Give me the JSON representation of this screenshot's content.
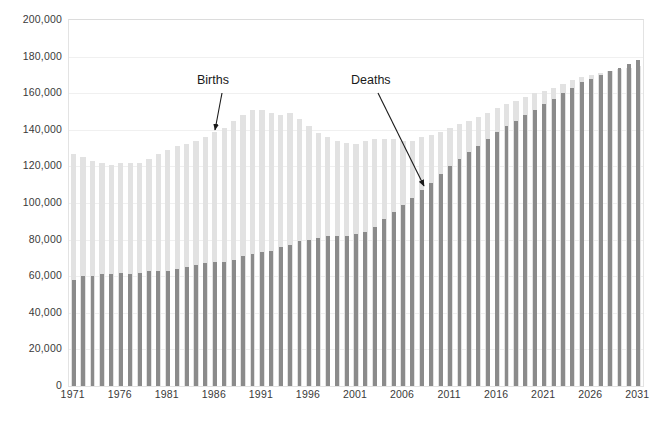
{
  "chart_data": {
    "type": "bar",
    "title": "",
    "subtitle": "",
    "xlabel": "",
    "ylabel": "",
    "ylim": [
      0,
      200000
    ],
    "ytick_step": 20000,
    "ytick_labels": [
      "0",
      "20,000",
      "40,000",
      "60,000",
      "80,000",
      "100,000",
      "120,000",
      "140,000",
      "160,000",
      "180,000",
      "200,000"
    ],
    "ytick_values": [
      0,
      20000,
      40000,
      60000,
      80000,
      100000,
      120000,
      140000,
      160000,
      180000,
      200000
    ],
    "grid": true,
    "legend_position": "annotations",
    "xtick_labels": [
      "1971",
      "1976",
      "1981",
      "1986",
      "1991",
      "1996",
      "2001",
      "2006",
      "2011",
      "2016",
      "2021",
      "2026",
      "2031"
    ],
    "xtick_values": [
      1971,
      1976,
      1981,
      1986,
      1991,
      1996,
      2001,
      2006,
      2011,
      2016,
      2021,
      2026,
      2031
    ],
    "categories": [
      1971,
      1972,
      1973,
      1974,
      1975,
      1976,
      1977,
      1978,
      1979,
      1980,
      1981,
      1982,
      1983,
      1984,
      1985,
      1986,
      1987,
      1988,
      1989,
      1990,
      1991,
      1992,
      1993,
      1994,
      1995,
      1996,
      1997,
      1998,
      1999,
      2000,
      2001,
      2002,
      2003,
      2004,
      2005,
      2006,
      2007,
      2008,
      2009,
      2010,
      2011,
      2012,
      2013,
      2014,
      2015,
      2016,
      2017,
      2018,
      2019,
      2020,
      2021,
      2022,
      2023,
      2024,
      2025,
      2026,
      2027,
      2028,
      2029,
      2030,
      2031
    ],
    "series": [
      {
        "name": "Births",
        "color": "#e2e2e2",
        "values": [
          127000,
          125000,
          123000,
          122000,
          121000,
          122000,
          122000,
          122000,
          124000,
          127000,
          129000,
          131000,
          132000,
          134000,
          136000,
          139000,
          141000,
          145000,
          148000,
          151000,
          151000,
          149000,
          148000,
          149000,
          146000,
          142000,
          138000,
          136000,
          134000,
          133000,
          132000,
          134000,
          135000,
          135000,
          135000,
          134000,
          134000,
          136000,
          137000,
          139000,
          141000,
          143000,
          145000,
          147000,
          149000,
          152000,
          154000,
          156000,
          158000,
          160000,
          161000,
          163000,
          165000,
          167000,
          169000,
          170000,
          171000,
          172000,
          173000,
          174000,
          175000
        ]
      },
      {
        "name": "Deaths",
        "color": "#8b8b8b",
        "values": [
          58000,
          60000,
          60000,
          61000,
          61000,
          62000,
          61000,
          62000,
          63000,
          63000,
          63000,
          64000,
          65000,
          66000,
          67000,
          68000,
          68000,
          69000,
          71000,
          72000,
          73000,
          74000,
          76000,
          77000,
          79000,
          80000,
          81000,
          82000,
          82000,
          82000,
          83000,
          84000,
          87000,
          91000,
          95000,
          99000,
          103000,
          107000,
          111000,
          116000,
          120000,
          124000,
          128000,
          131000,
          135000,
          139000,
          142000,
          145000,
          148000,
          151000,
          154000,
          157000,
          160000,
          163000,
          166000,
          168000,
          170000,
          172000,
          174000,
          176000,
          178000
        ]
      }
    ],
    "annotations": [
      {
        "text": "Births",
        "points_to_series": "Births",
        "points_to_year": 1985
      },
      {
        "text": "Deaths",
        "points_to_series": "Deaths",
        "points_to_year": 2009
      }
    ]
  }
}
